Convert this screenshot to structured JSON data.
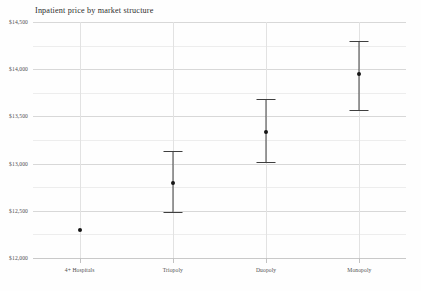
{
  "chart_data": {
    "type": "scatter",
    "title": "Inpatient price by market structure",
    "xlabel": "",
    "ylabel": "",
    "categories": [
      "4+ Hospitals",
      "Triopoly",
      "Duopoly",
      "Monopoly"
    ],
    "values": [
      12300,
      12795,
      13335,
      13950
    ],
    "ci_low": [
      null,
      12485,
      13020,
      13570
    ],
    "ci_high": [
      null,
      13130,
      13680,
      14300
    ],
    "ylim": [
      12000,
      14500
    ],
    "ytick_labels": [
      "$12,000",
      "$12,500",
      "$13,000",
      "$13,500",
      "$14,000",
      "$14,500"
    ],
    "ytick_values": [
      12000,
      12500,
      13000,
      13500,
      14000,
      14500
    ],
    "minor_gridlines": true,
    "grid": true,
    "legend": "none",
    "marker_color": "#161616",
    "errorbar_color": "#3f3f3f",
    "gridline_color": "#d8d8d8",
    "background_color": "#fefefe"
  },
  "footer": {
    "caption_partial": ""
  }
}
